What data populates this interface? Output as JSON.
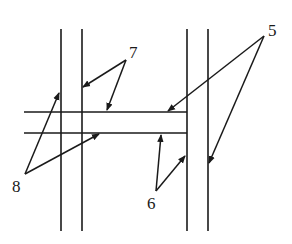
{
  "diagram": {
    "type": "structural cross-section",
    "vertical_lines_x": [
      61,
      82,
      187,
      208
    ],
    "vertical_lines_y": [
      29,
      231
    ],
    "horizontal_lines_y": [
      112,
      133
    ],
    "horizontal_lines_x": [
      24,
      187
    ],
    "labels": [
      {
        "id": "5",
        "text": "5",
        "x": 268,
        "y": 36,
        "apex": [
          264,
          36
        ],
        "targets": [
          [
            168,
            111
          ],
          [
            209,
            163
          ]
        ]
      },
      {
        "id": "6",
        "text": "6",
        "x": 147,
        "y": 209,
        "apex": [
          156,
          191
        ],
        "targets": [
          [
            161,
            135
          ],
          [
            185,
            156
          ]
        ]
      },
      {
        "id": "7",
        "text": "7",
        "x": 129,
        "y": 58,
        "apex": [
          126,
          60
        ],
        "targets": [
          [
            83,
            87
          ],
          [
            107,
            110
          ]
        ]
      },
      {
        "id": "8",
        "text": "8",
        "x": 12,
        "y": 192,
        "apex": [
          25,
          174
        ],
        "targets": [
          [
            59,
            93
          ],
          [
            99,
            134
          ]
        ]
      }
    ]
  }
}
